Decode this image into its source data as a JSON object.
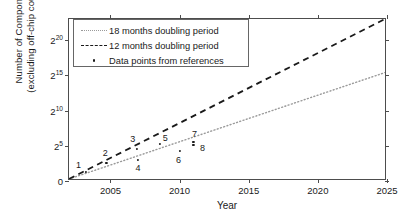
{
  "chart_data": {
    "type": "line",
    "title": "",
    "xlabel": "Year",
    "ylabel_line1": "Number of Components",
    "ylabel_line2": "(excluding off-chip couplers)",
    "xlim": [
      2002,
      2025
    ],
    "ylim_log2": [
      0,
      23
    ],
    "grid": false,
    "legend_position": "upper left",
    "xticks": [
      "2005",
      "2010",
      "2015",
      "2020",
      "2025"
    ],
    "xtick_values": [
      2005,
      2010,
      2015,
      2020,
      2025
    ],
    "yticks": [
      "0",
      "2^5",
      "2^10",
      "2^15",
      "2^20"
    ],
    "ytick_exponents": [
      0,
      5,
      10,
      15,
      20
    ],
    "ytick_bases": [
      "0",
      "2",
      "2",
      "2",
      "2"
    ],
    "ytick_sups": [
      "",
      "5",
      "10",
      "15",
      "20"
    ],
    "series": [
      {
        "name": "18 months doubling period",
        "style": "dotted",
        "color": "#9a9a9a",
        "x": [
          2002,
          2025
        ],
        "y_log2": [
          0,
          15.3
        ]
      },
      {
        "name": "12 months doubling period",
        "style": "dashed",
        "color": "#1a1a1a",
        "x": [
          2002,
          2025
        ],
        "y_log2": [
          0,
          23
        ]
      },
      {
        "name": "Data points from references",
        "style": "markers",
        "color": "#1a1a1a",
        "points": [
          {
            "label": "1",
            "year": 2003.2,
            "y_log2": 1.3,
            "label_dx": -7,
            "label_dy": -7
          },
          {
            "label": "2",
            "year": 2004.7,
            "y_log2": 2.6,
            "label_dx": -1,
            "label_dy": -10
          },
          {
            "label": "3",
            "year": 2006.9,
            "y_log2": 4.6,
            "label_dx": -4,
            "label_dy": -10
          },
          {
            "label": "4",
            "year": 2007.0,
            "y_log2": 3.0,
            "label_dx": 0,
            "label_dy": 8
          },
          {
            "label": "5",
            "year": 2008.6,
            "y_log2": 5.3,
            "label_dx": 5,
            "label_dy": -6
          },
          {
            "label": "6",
            "year": 2010.0,
            "y_log2": 4.3,
            "label_dx": -1,
            "label_dy": 9
          },
          {
            "label": "7",
            "year": 2011.0,
            "y_log2": 5.6,
            "label_dx": 1,
            "label_dy": -8
          },
          {
            "label": "8",
            "year": 2011.0,
            "y_log2": 5.1,
            "label_dx": 9,
            "label_dy": 3
          }
        ]
      }
    ],
    "legend_entries": [
      {
        "label": "18 months doubling period",
        "key": "dotted-line-key"
      },
      {
        "label": "12 months doubling period",
        "key": "dashed-line-key"
      },
      {
        "label": "Data points from references",
        "key": "marker-key"
      }
    ]
  }
}
